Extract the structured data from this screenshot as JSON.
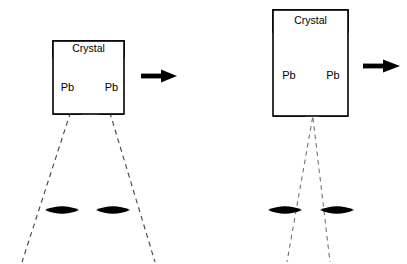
{
  "figure": {
    "background_color": "#ffffff",
    "line_color": "#000000",
    "ray_color": "#4a4a4a",
    "fill_color": "#000000",
    "width": 407,
    "height": 264
  },
  "panels": [
    {
      "id": "left-panel",
      "name": "wide-collimation",
      "crystal": {
        "label": "Crystal",
        "box": {
          "x": 53,
          "y": 41,
          "width": 71,
          "height": 73
        },
        "band": {
          "x": 53,
          "y": 41,
          "width": 71,
          "height": 16
        }
      },
      "shields": [
        {
          "label": "Pb",
          "side": "left",
          "x": 54,
          "y": 57,
          "width": 27,
          "height": 57,
          "label_x": 67.5,
          "label_y": 88
        },
        {
          "label": "Pb",
          "side": "right",
          "x": 100,
          "y": 57,
          "width": 23,
          "height": 57,
          "label_x": 111.5,
          "label_y": 88
        }
      ],
      "aperture": {
        "x1": 81,
        "x2": 100,
        "y_top": 57,
        "y_bottom": 114
      },
      "rays": [
        {
          "name": "ray-left-outer",
          "points": "100,58 81,80 22,262"
        },
        {
          "name": "ray-right-outer",
          "points": "81,58 100,80 155,262"
        }
      ],
      "arrowheads_up": [
        {
          "x": 100,
          "y": 58,
          "direction": "up"
        },
        {
          "x": 81,
          "y": 58,
          "direction": "up"
        }
      ],
      "sources": [
        {
          "name": "source-left",
          "cx": 62,
          "cy": 210,
          "rx": 17,
          "ry": 5.5,
          "fill": "#000000"
        },
        {
          "name": "source-right",
          "cx": 113,
          "cy": 210,
          "rx": 17,
          "ry": 5.5,
          "fill": "#000000"
        }
      ],
      "direction_arrow": {
        "name": "beam-direction-arrow",
        "x": 141,
        "y": 76,
        "length": 35,
        "direction": "right"
      }
    },
    {
      "id": "right-panel",
      "name": "narrow-collimation",
      "crystal": {
        "label": "Crystal",
        "box": {
          "x": 273,
          "y": 10,
          "width": 75,
          "height": 106
        },
        "band": {
          "x": 273,
          "y": 10,
          "width": 75,
          "height": 22
        }
      },
      "shields": [
        {
          "label": "Pb",
          "side": "left",
          "x": 274,
          "y": 32,
          "width": 31,
          "height": 84,
          "label_x": 289,
          "label_y": 76
        },
        {
          "label": "Pb",
          "side": "right",
          "x": 320,
          "y": 32,
          "width": 27,
          "height": 84,
          "label_x": 333,
          "label_y": 76
        }
      ],
      "aperture": {
        "x1": 305,
        "x2": 320,
        "y_top": 32,
        "y_bottom": 116
      },
      "rays": [
        {
          "name": "ray-left-inner",
          "points": "306,33 312,112 287,262"
        },
        {
          "name": "ray-right-inner",
          "points": "319,33 313,112 330,262"
        }
      ],
      "arrowheads_up": [
        {
          "x": 306,
          "y": 33,
          "direction": "up"
        },
        {
          "x": 319,
          "y": 33,
          "direction": "up"
        }
      ],
      "sources": [
        {
          "name": "source-left",
          "cx": 285,
          "cy": 210,
          "rx": 17,
          "ry": 5.5,
          "fill": "#000000"
        },
        {
          "name": "source-right",
          "cx": 337,
          "cy": 210,
          "rx": 17,
          "ry": 5.5,
          "fill": "#000000"
        }
      ],
      "direction_arrow": {
        "name": "beam-direction-arrow",
        "x": 363,
        "y": 66,
        "length": 37,
        "direction": "right"
      }
    }
  ],
  "labels": {
    "crystal": "Crystal",
    "pb": "Pb"
  }
}
